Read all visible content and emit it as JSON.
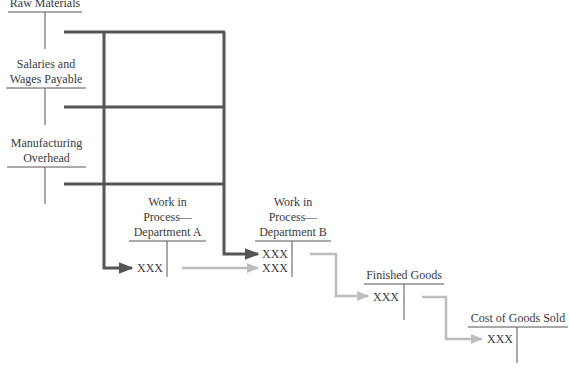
{
  "diagram": {
    "type": "t-account-cost-flow",
    "colors": {
      "dark_flow": "#555555",
      "light_flow": "#bdbdbd",
      "t_account_line": "#555555",
      "text": "#3a3a3a"
    },
    "accounts": [
      {
        "id": "raw-materials",
        "title_lines": [
          "Raw Materials"
        ]
      },
      {
        "id": "salaries-wages-payable",
        "title_lines": [
          "Salaries and",
          "Wages Payable"
        ]
      },
      {
        "id": "manufacturing-overhead",
        "title_lines": [
          "Manufacturing",
          "Overhead"
        ]
      },
      {
        "id": "wip-dept-a",
        "title_lines": [
          "Work in",
          "Process—",
          "Department A"
        ],
        "debits": [
          "XXX"
        ]
      },
      {
        "id": "wip-dept-b",
        "title_lines": [
          "Work in",
          "Process—",
          "Department B"
        ],
        "debits": [
          "XXX",
          "XXX"
        ]
      },
      {
        "id": "finished-goods",
        "title_lines": [
          "Finished Goods"
        ],
        "debits": [
          "XXX"
        ]
      },
      {
        "id": "cost-of-goods-sold",
        "title_lines": [
          "Cost of Goods Sold"
        ],
        "debits": [
          "XXX"
        ]
      }
    ],
    "flows": [
      {
        "from": "raw-materials",
        "to": "wip-dept-a",
        "style": "dark"
      },
      {
        "from": "raw-materials",
        "to": "wip-dept-b",
        "style": "dark"
      },
      {
        "from": "salaries-wages-payable",
        "to": "wip-dept-a",
        "style": "dark"
      },
      {
        "from": "salaries-wages-payable",
        "to": "wip-dept-b",
        "style": "dark"
      },
      {
        "from": "manufacturing-overhead",
        "to": "wip-dept-a",
        "style": "dark"
      },
      {
        "from": "manufacturing-overhead",
        "to": "wip-dept-b",
        "style": "dark"
      },
      {
        "from": "wip-dept-a",
        "to": "wip-dept-b",
        "style": "light"
      },
      {
        "from": "wip-dept-b",
        "to": "finished-goods",
        "style": "light"
      },
      {
        "from": "finished-goods",
        "to": "cost-of-goods-sold",
        "style": "light"
      }
    ]
  }
}
